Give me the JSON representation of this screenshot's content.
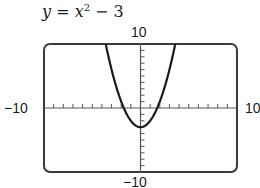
{
  "chart_data": {
    "type": "line",
    "title_parts": {
      "lhs": "y",
      "eq": " = ",
      "var": "x",
      "exp": "2",
      "rest": " − 3"
    },
    "function": "x^2 - 3",
    "xlabel": "",
    "ylabel": "",
    "xlim": [
      -10,
      10
    ],
    "ylim": [
      -10,
      10
    ],
    "xscale": 1,
    "yscale": 1,
    "tick_labels": {
      "ymax": "10",
      "ymin": "−10",
      "xmin": "−10",
      "xmax": "10"
    },
    "grid": false,
    "legend": null,
    "series": [
      {
        "name": "y = x^2 - 3",
        "x": [
          -3.606,
          -3,
          -2,
          -1,
          0,
          1,
          2,
          3,
          3.606
        ],
        "y": [
          10,
          6,
          1,
          -2,
          -3,
          -2,
          1,
          6,
          10
        ]
      }
    ],
    "x_intercepts": [
      -1.732,
      1.732
    ],
    "y_intercept": -3,
    "vertex": [
      0,
      -3
    ]
  },
  "colors": {
    "frame": "#3a3a3a",
    "curve": "#1a1a1a",
    "axes": "#555555"
  }
}
